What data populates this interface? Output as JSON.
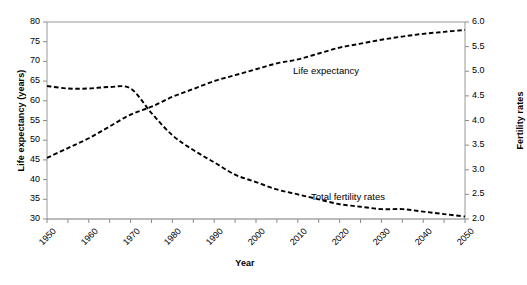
{
  "chart_data": {
    "type": "line",
    "title": "",
    "xlabel": "Year",
    "ylabel": "Life expectancy (years)",
    "y2label": "Fertility rates",
    "xlim": [
      1950,
      2050
    ],
    "ylim": [
      30,
      80
    ],
    "y2lim": [
      2.0,
      6.0
    ],
    "grid": false,
    "legend_position": "inline-annotations",
    "x_tick_labels": [
      "1950",
      "1960",
      "1970",
      "1980",
      "1990",
      "2000",
      "2010",
      "2020",
      "2030",
      "2040",
      "2050"
    ],
    "x_tick_values": [
      1950,
      1960,
      1970,
      1980,
      1990,
      2000,
      2010,
      2020,
      2030,
      2040,
      2050
    ],
    "x_minor_tick_step": 5,
    "y_tick_labels": [
      "30",
      "35",
      "40",
      "45",
      "50",
      "55",
      "60",
      "65",
      "70",
      "75",
      "80"
    ],
    "y_tick_values": [
      30,
      35,
      40,
      45,
      50,
      55,
      60,
      65,
      70,
      75,
      80
    ],
    "y2_tick_labels": [
      "2.0",
      "2.5",
      "3.0",
      "3.5",
      "4.0",
      "4.5",
      "5.0",
      "5.5",
      "6.0"
    ],
    "y2_tick_values": [
      2.0,
      2.5,
      3.0,
      3.5,
      4.0,
      4.5,
      5.0,
      5.5,
      6.0
    ],
    "x": [
      1950,
      1955,
      1960,
      1965,
      1970,
      1975,
      1980,
      1985,
      1990,
      1995,
      2000,
      2005,
      2010,
      2015,
      2020,
      2025,
      2030,
      2035,
      2040,
      2045,
      2050
    ],
    "series": [
      {
        "name": "Life expectancy",
        "axis": "left",
        "units": "years",
        "color": "#000000",
        "linestyle": "dashed",
        "values": [
          45.5,
          48.0,
          50.5,
          53.5,
          56.5,
          58.5,
          61.0,
          63.0,
          65.0,
          66.5,
          68.0,
          69.5,
          70.5,
          72.0,
          73.5,
          74.5,
          75.5,
          76.3,
          77.0,
          77.5,
          78.0
        ]
      },
      {
        "name": "Total fertility rates",
        "axis": "right",
        "units": "births per woman",
        "color": "#000000",
        "linestyle": "dashed",
        "values": [
          4.7,
          4.65,
          4.65,
          4.68,
          4.65,
          4.15,
          3.7,
          3.4,
          3.15,
          2.9,
          2.75,
          2.6,
          2.5,
          2.4,
          2.3,
          2.25,
          2.2,
          2.2,
          2.15,
          2.1,
          2.05
        ]
      }
    ],
    "annotations": [
      {
        "text": "Life expectancy",
        "series": "Life expectancy"
      },
      {
        "text": "Total fertility rates",
        "series": "Total fertility rates"
      }
    ]
  },
  "axes": {
    "left_title": "Life expectancy (years)",
    "right_title": "Fertility rates",
    "x_title": "Year"
  },
  "labels": {
    "life_expectancy": "Life expectancy",
    "total_fertility_rates": "Total fertility rates"
  }
}
